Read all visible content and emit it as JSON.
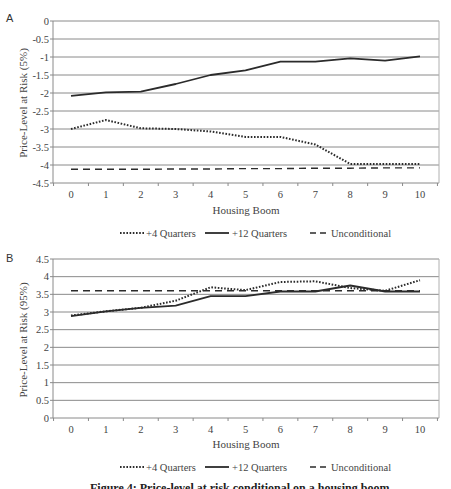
{
  "chart_data": [
    {
      "panel": "A",
      "type": "line",
      "title": "",
      "xlabel": "Housing Boom",
      "ylabel": "Price-Level at Risk (5%)",
      "x": [
        0,
        1,
        2,
        3,
        4,
        5,
        6,
        7,
        8,
        9,
        10
      ],
      "x_tick_labels": [
        "0",
        "1",
        "2",
        "3",
        "4",
        "5",
        "6",
        "7",
        "8",
        "9",
        "10"
      ],
      "y_tick_labels": [
        "0",
        "-0.5",
        "-1",
        "-1.5",
        "-2",
        "-2.5",
        "-3",
        "-3.5",
        "-4",
        "-4.5"
      ],
      "ylim": [
        -4.5,
        0
      ],
      "grid": true,
      "legend_position": "bottom",
      "series": [
        {
          "name": "+4 Quarters",
          "style": "dotted",
          "values": [
            -3.0,
            -2.75,
            -2.98,
            -3.0,
            -3.07,
            -3.22,
            -3.22,
            -3.43,
            -3.97,
            -3.97,
            -3.97
          ]
        },
        {
          "name": "+12 Quarters",
          "style": "solid",
          "values": [
            -2.08,
            -1.98,
            -1.96,
            -1.75,
            -1.5,
            -1.37,
            -1.13,
            -1.13,
            -1.04,
            -1.1,
            -0.98
          ]
        },
        {
          "name": "Unconditional",
          "style": "dashed",
          "values": [
            -4.12,
            -4.12,
            -4.12,
            -4.11,
            -4.11,
            -4.1,
            -4.1,
            -4.09,
            -4.09,
            -4.08,
            -4.08
          ]
        }
      ]
    },
    {
      "panel": "B",
      "type": "line",
      "title": "",
      "xlabel": "Housing Boom",
      "ylabel": "Price-Level at Risk (95%)",
      "x": [
        0,
        1,
        2,
        3,
        4,
        5,
        6,
        7,
        8,
        9,
        10
      ],
      "x_tick_labels": [
        "0",
        "1",
        "2",
        "3",
        "4",
        "5",
        "6",
        "7",
        "8",
        "9",
        "10"
      ],
      "y_tick_labels": [
        "4.5",
        "4",
        "3.5",
        "3",
        "2.5",
        "2",
        "1.5",
        "1",
        "0.5",
        "0"
      ],
      "ylim": [
        0,
        4.5
      ],
      "grid": true,
      "legend_position": "bottom",
      "series": [
        {
          "name": "+4 Quarters",
          "style": "dotted",
          "values": [
            2.9,
            3.02,
            3.12,
            3.32,
            3.7,
            3.62,
            3.85,
            3.87,
            3.68,
            3.6,
            3.9
          ]
        },
        {
          "name": "+12 Quarters",
          "style": "solid",
          "values": [
            2.88,
            3.02,
            3.12,
            3.18,
            3.45,
            3.45,
            3.58,
            3.58,
            3.75,
            3.58,
            3.58
          ]
        },
        {
          "name": "Unconditional",
          "style": "dashed",
          "values": [
            3.6,
            3.6,
            3.6,
            3.6,
            3.6,
            3.6,
            3.6,
            3.6,
            3.6,
            3.6,
            3.6
          ]
        }
      ]
    }
  ],
  "panels": {
    "a": {
      "letter": "A",
      "ylabel": "Price-Level at Risk (5%)",
      "xlabel": "Housing Boom"
    },
    "b": {
      "letter": "B",
      "ylabel": "Price-Level at Risk (95%)",
      "xlabel": "Housing Boom"
    }
  },
  "legend": {
    "items": [
      {
        "label": "+4 Quarters",
        "style": "dotted"
      },
      {
        "label": "+12 Quarters",
        "style": "solid"
      },
      {
        "label": "Unconditional",
        "style": "dashed"
      }
    ]
  },
  "caption": {
    "text": "Figure 4: Price-level at risk conditional on a housing boom"
  },
  "colors": {
    "line": "#2b2b2b",
    "grid": "#8a8a8a",
    "frame": "#b0b0b0",
    "text": "#444444"
  }
}
